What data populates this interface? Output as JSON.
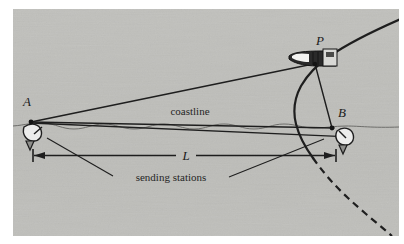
{
  "figure": {
    "background_color": "#ffffff",
    "panel_color": "#c9c9c6",
    "ink_color": "#1e1e1e",
    "panel": {
      "x": 13,
      "y": 9,
      "width": 386,
      "height": 227
    }
  },
  "labels": {
    "point_a": "A",
    "point_b": "B",
    "point_p": "P",
    "baseline_length": "L",
    "coastline": "coastline",
    "sending_stations": "sending stations"
  },
  "icons": {
    "station_a": "dish-antenna-icon",
    "station_b": "dish-antenna-icon",
    "ship": "ship-icon"
  },
  "geometry": {
    "station_a": {
      "x": 31,
      "y": 122
    },
    "station_b": {
      "x": 332,
      "y": 128
    },
    "ship_p": {
      "x": 313,
      "y": 60
    },
    "dimension_line_y": 155,
    "coastline_y": 126,
    "curve_style_upper": "solid",
    "curve_style_lower": "dashed"
  }
}
